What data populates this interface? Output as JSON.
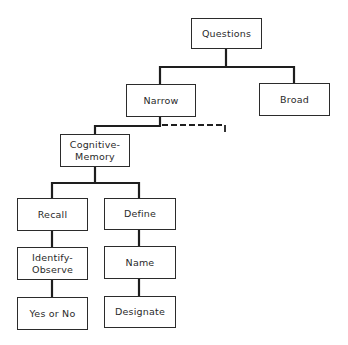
{
  "diagram": {
    "type": "tree",
    "nodes": {
      "questions": "Questions",
      "narrow": "Narrow",
      "broad": "Broad",
      "cognitive_memory": "Cognitive-\nMemory",
      "recall": "Recall",
      "identify_observe": "Identify-\nObserve",
      "yes_or_no": "Yes or No",
      "define": "Define",
      "name": "Name",
      "designate": "Designate"
    },
    "edges": [
      [
        "Questions",
        "Narrow"
      ],
      [
        "Questions",
        "Broad"
      ],
      [
        "Narrow",
        "Cognitive-Memory"
      ],
      [
        "Narrow",
        "(dashed, unlabeled branch)"
      ],
      [
        "Cognitive-Memory",
        "Recall"
      ],
      [
        "Cognitive-Memory",
        "Define"
      ],
      [
        "Recall",
        "Identify-Observe"
      ],
      [
        "Identify-Observe",
        "Yes or No"
      ],
      [
        "Define",
        "Name"
      ],
      [
        "Name",
        "Designate"
      ]
    ]
  }
}
